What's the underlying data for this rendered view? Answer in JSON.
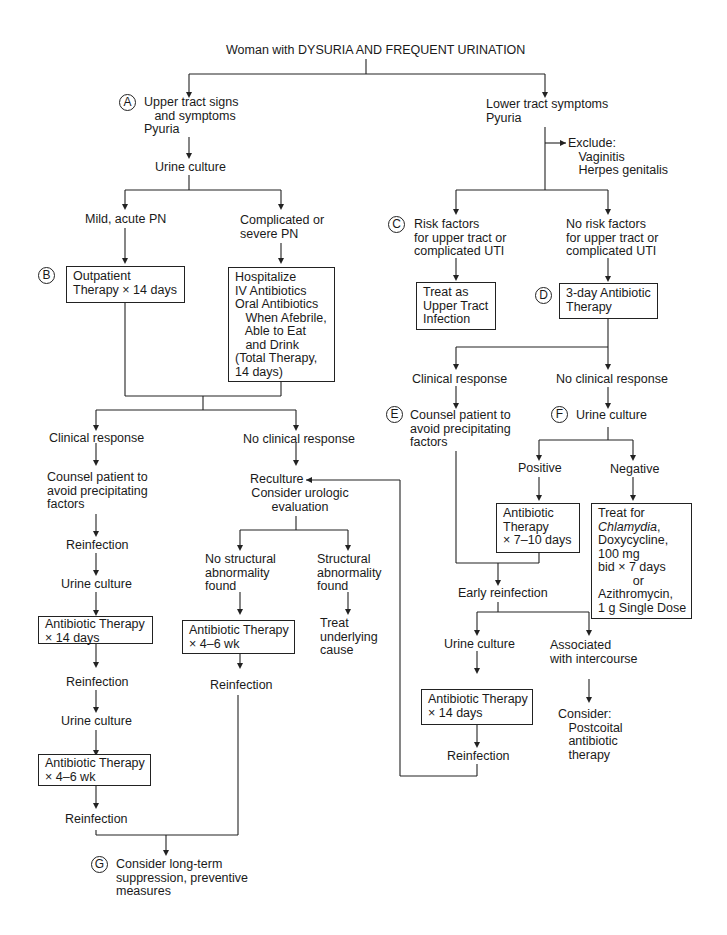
{
  "title": "Woman with DYSURIA AND FREQUENT URINATION",
  "badges": {
    "A": "A",
    "B": "B",
    "C": "C",
    "D": "D",
    "E": "E",
    "F": "F",
    "G": "G"
  },
  "colors": {
    "line": "#222222",
    "text": "#1a1a1a",
    "background": "#ffffff"
  },
  "upper": {
    "signs": "Upper tract signs\n   and symptoms\nPyuria",
    "urine_culture": "Urine culture",
    "mild": "Mild, acute PN",
    "complicated": "Complicated or\nsevere PN",
    "outpatient_box": "Outpatient\nTherapy × 14 days",
    "hospitalize_box": "Hospitalize\nIV Antibiotics\nOral Antibiotics\n   When Afebrile,\n   Able to Eat\n   and Drink\n(Total Therapy,\n14 days)",
    "clinical_response": "Clinical response",
    "no_clinical_response": "No clinical response",
    "counsel": "Counsel patient to\navoid precipitating\nfactors",
    "reinfection_1": "Reinfection",
    "urine_culture_2": "Urine culture",
    "abx_14_box": "Antibiotic Therapy\n× 14 days",
    "reinfection_2": "Reinfection",
    "urine_culture_3": "Urine culture",
    "abx_4_6_box": "Antibiotic Therapy\n× 4–6 wk",
    "reinfection_3": "Reinfection",
    "reculture": "Reculture",
    "consider_urologic": "Consider urologic\nevaluation",
    "no_structural": "No structural\nabnormality\nfound",
    "structural": "Structural\nabnormality\nfound",
    "abx_4_6_box_b": "Antibiotic Therapy\n× 4–6 wk",
    "treat_underlying": "Treat\nunderlying\ncause",
    "reinfection_4": "Reinfection",
    "long_term": "Consider long-term\nsuppression, preventive\nmeasures"
  },
  "lower": {
    "symptoms": "Lower tract symptoms\nPyuria",
    "exclude": "Exclude:\n   Vaginitis\n   Herpes genitalis",
    "risk_factors": "Risk factors\nfor upper tract or\ncomplicated UTI",
    "no_risk_factors": "No risk factors\nfor upper tract or\ncomplicated UTI",
    "treat_upper_box": "Treat as\nUpper Tract\nInfection",
    "three_day_box": "3-day Antibiotic\nTherapy",
    "clinical_response": "Clinical response",
    "no_clinical_response": "No clinical response",
    "counsel": "Counsel patient to\navoid precipitating\nfactors",
    "urine_culture": "Urine culture",
    "positive": "Positive",
    "negative": "Negative",
    "abx_7_10_box": "Antibiotic\nTherapy\n× 7–10 days",
    "chlamydia_box_1": "Treat for",
    "chlamydia_italic": "Chlamydia",
    "chlamydia_box_2": ",\nDoxycycline,\n100 mg\nbid × 7 days\n          or\nAzithromycin,\n1 g Single Dose",
    "early_reinfection": "Early reinfection",
    "urine_culture_2": "Urine culture",
    "associated": "Associated\nwith intercourse",
    "abx_14_box": "Antibiotic Therapy\n× 14 days",
    "reinfection": "Reinfection",
    "consider": "Consider:\n   Postcoital\n   antibiotic\n   therapy"
  }
}
